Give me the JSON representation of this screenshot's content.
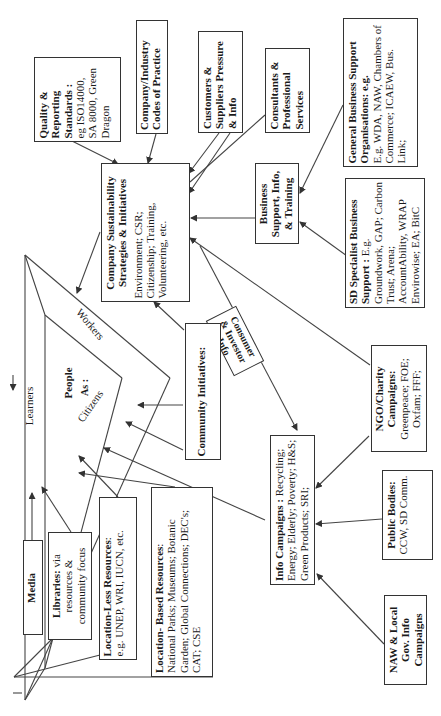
{
  "diagram": {
    "type": "influence-map",
    "orientation": "rotated-90-ccw",
    "center": {
      "title": "People",
      "subtitle": "As :",
      "roles": [
        "Learners",
        "Workers",
        "Citizens"
      ]
    },
    "nodes": {
      "quality": {
        "title": "Quality & Reporting Standards",
        "title_suffix": " :",
        "body": "eg ISO14000, SA 8000, Green Dragon"
      },
      "codes": {
        "title": "Company/Industry Codes of Practice"
      },
      "customers": {
        "title": "Customers & Suppliers Pressure & Info"
      },
      "consultants": {
        "title": "Consultants & Professional Services"
      },
      "general_support": {
        "title": "General Business Support Organisations: e.g.",
        "body": "E.g. WDA, NAW, Chambers of Commerce; ICAEW, Bus. Link;"
      },
      "company": {
        "title": "Company Sustainability Strategies & Initiatives",
        "body": "Environment; CSR; Citizenship; Training, Volunteering, etc."
      },
      "business_support": {
        "title": "Business Support, Info, & Training"
      },
      "sd_specialist": {
        "title": "SD Specialist Business Support :",
        "body": "E.g. Groundwork, GAP; Carbon Trust; Arena; AccountAbility, WRAP Envirowise; EA; BitC"
      },
      "consumer_info": {
        "title": "Consumer & Investor Info"
      },
      "community": {
        "title": "Community Initiatives:"
      },
      "ngo": {
        "title": "NGO/Charity Campaigns:",
        "body": "Greenpeace; FOE; Oxfam; FFF;"
      },
      "info_campaigns": {
        "title": "Info Campaigns",
        "title_suffix": " : ",
        "body": "Recycling; Energy; Elderly; Poverty; H&S; Green Products; SRI;"
      },
      "public_bodies": {
        "title": "Public Bodies:",
        "body": "CCW, SD Comm."
      },
      "naw_local": {
        "title": "NAW & Local Gov. Info Campaigns"
      },
      "media": {
        "title": "Media"
      },
      "libraries": {
        "title": "Libraries:",
        "body": " via resources & community focus"
      },
      "location_less": {
        "title": "Location-Less Resources",
        "title_suffix": ":",
        "body": "e.g. UNEP, WRI, IUCN, etc."
      },
      "location_based": {
        "title": "Location- Based Resources",
        "title_suffix": ":",
        "body": "National Parks; Museums; Botanic Garden; Global Connections; DEC's; CAT; CSE"
      }
    }
  }
}
